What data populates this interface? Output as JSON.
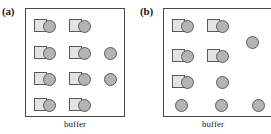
{
  "figure": {
    "type": "schematic-diagram",
    "colors": {
      "square_fill": "#e3e3e3",
      "circle_fill": "#b4b4b4",
      "outline": "#5a5a5a",
      "chamber_border": "#4a4a4a",
      "background": "#ffffff"
    },
    "panels": [
      {
        "id": "a",
        "label": "(a)",
        "caption": "buffer",
        "particles": [
          {
            "kind": "pair",
            "x": 8,
            "y": 10
          },
          {
            "kind": "pair",
            "x": 43,
            "y": 10
          },
          {
            "kind": "pair",
            "x": 8,
            "y": 37
          },
          {
            "kind": "pair",
            "x": 43,
            "y": 37
          },
          {
            "kind": "lone",
            "x": 78,
            "y": 38
          },
          {
            "kind": "pair",
            "x": 8,
            "y": 63
          },
          {
            "kind": "pair",
            "x": 43,
            "y": 63
          },
          {
            "kind": "lone",
            "x": 78,
            "y": 64
          },
          {
            "kind": "pair",
            "x": 8,
            "y": 89
          },
          {
            "kind": "pair",
            "x": 43,
            "y": 89
          }
        ]
      },
      {
        "id": "b",
        "label": "(b)",
        "caption": "buffer",
        "particles": [
          {
            "kind": "pair",
            "x": 8,
            "y": 10
          },
          {
            "kind": "pair",
            "x": 43,
            "y": 10
          },
          {
            "kind": "lone",
            "x": 82,
            "y": 27
          },
          {
            "kind": "pair",
            "x": 8,
            "y": 40
          },
          {
            "kind": "pair",
            "x": 43,
            "y": 40
          },
          {
            "kind": "pair",
            "x": 8,
            "y": 66
          },
          {
            "kind": "lone",
            "x": 52,
            "y": 67
          },
          {
            "kind": "lone",
            "x": 11,
            "y": 90
          },
          {
            "kind": "lone",
            "x": 51,
            "y": 90
          },
          {
            "kind": "lone",
            "x": 88,
            "y": 90
          }
        ]
      }
    ]
  }
}
